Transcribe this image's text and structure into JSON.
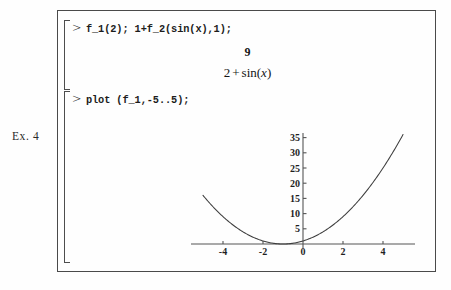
{
  "figure": {
    "caption": "Ex. 4"
  },
  "worksheet": {
    "prompt_symbol": ">",
    "groups": [
      {
        "input": "f_1(2); 1+f_2(sin(x),1);",
        "outputs": [
          "9",
          "2 + sin(x)"
        ]
      },
      {
        "input": "plot (f_1,-5..5);",
        "outputs": []
      }
    ],
    "inputs": {
      "line1": "f_1(2); 1+f_2(sin(x),1);",
      "line2": "plot (f_1,-5..5);"
    },
    "outputs": {
      "result1": "9",
      "result2_lhs": "2",
      "result2_op": "+",
      "result2_fn": "sin(",
      "result2_var": "x",
      "result2_close": ")"
    }
  },
  "chart_data": {
    "type": "line",
    "title": "",
    "xlabel": "",
    "ylabel": "",
    "expression": "(x+1)^2",
    "xlim": [
      -5,
      5
    ],
    "ylim": [
      0,
      36
    ],
    "grid": false,
    "legend": null,
    "xticks": [
      -4,
      -2,
      0,
      2,
      4
    ],
    "xtick_labels": [
      "-4",
      "-2",
      "0",
      "2",
      "4"
    ],
    "yticks": [
      5,
      10,
      15,
      20,
      25,
      30,
      35
    ],
    "ytick_labels": [
      "5",
      "10",
      "15",
      "20",
      "25",
      "30",
      "35"
    ],
    "series": [
      {
        "name": "f_1",
        "x": [
          -5,
          -4.5,
          -4,
          -3.5,
          -3,
          -2.5,
          -2,
          -1.5,
          -1,
          -0.5,
          0,
          0.5,
          1,
          1.5,
          2,
          2.5,
          3,
          3.5,
          4,
          4.5,
          5
        ],
        "values": [
          16,
          12.25,
          9,
          6.25,
          4,
          2.25,
          1,
          0.25,
          0,
          0.25,
          1,
          2.25,
          4,
          6.25,
          9,
          12.25,
          16,
          20.25,
          25,
          30.25,
          36
        ]
      }
    ],
    "colors": {
      "curve": "#3d3d3d",
      "axis": "#555555"
    }
  }
}
